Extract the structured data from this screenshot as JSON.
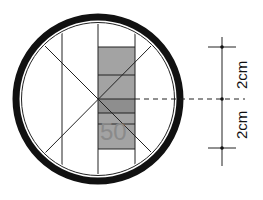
{
  "diagram": {
    "sign_number": "50",
    "dimensions": [
      {
        "label": "2cm",
        "position": "upper"
      },
      {
        "label": "2cm",
        "position": "lower"
      }
    ],
    "colors": {
      "ring": "#111111",
      "bar_fill": "#a3a3a3",
      "bar_center_fill": "#8e8e8e",
      "line": "#222222",
      "number": "#8a8a8a"
    }
  }
}
